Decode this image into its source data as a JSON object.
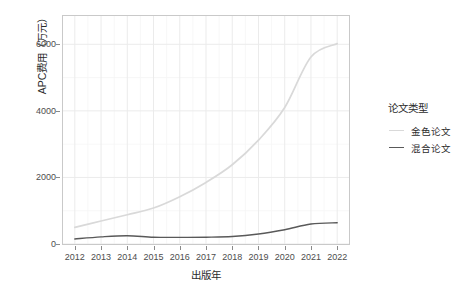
{
  "chart_data": {
    "type": "line",
    "title": "",
    "xlabel": "出版年",
    "ylabel": "APC费用（万元）",
    "x": [
      2012,
      2013,
      2014,
      2015,
      2016,
      2017,
      2018,
      2019,
      2020,
      2021,
      2022
    ],
    "xtick_labels": [
      "2012",
      "2013",
      "2014",
      "2015",
      "2016",
      "2017",
      "2018",
      "2019",
      "2020",
      "2021",
      "2022"
    ],
    "ytick_labels": [
      "0",
      "2000",
      "4000",
      "6000"
    ],
    "ytick_values": [
      0,
      2000,
      4000,
      6000
    ],
    "xlim": [
      2011.55,
      2022.45
    ],
    "ylim": [
      0,
      6850
    ],
    "grid": true,
    "legend_position": "right",
    "legend_title": "论文类型",
    "series": [
      {
        "name": "金色论文",
        "color": "#d9d9d9",
        "values": [
          500,
          690,
          880,
          1080,
          1420,
          1850,
          2380,
          3120,
          4100,
          5620,
          6020
        ]
      },
      {
        "name": "混合论文",
        "color": "#595959",
        "values": [
          150,
          215,
          250,
          205,
          200,
          205,
          225,
          300,
          430,
          600,
          640
        ]
      }
    ]
  },
  "legend": {
    "title": "论文类型",
    "items": [
      {
        "label": "金色论文",
        "color": "#d9d9d9"
      },
      {
        "label": "混合论文",
        "color": "#595959"
      }
    ]
  },
  "axes": {
    "x_title": "出版年",
    "y_title": "APC费用（万元）"
  },
  "colors": {
    "panel_background": "#ffffff",
    "grid_major": "#ebebeb",
    "grid_minor": "#f5f5f5",
    "panel_border": "#c9c9c9",
    "axis_text": "#4d4d4d",
    "title_text": "#2b2b2b",
    "gold_series": "#d9d9d9",
    "hybrid_series": "#595959"
  }
}
